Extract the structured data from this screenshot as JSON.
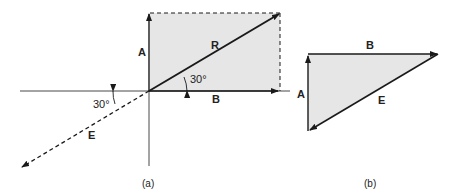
{
  "figure_a": {
    "caption": "(a)",
    "vectors": {
      "A": "A",
      "B": "B",
      "R": "R",
      "E": "E"
    },
    "angle_R": "30°",
    "angle_E": "30°"
  },
  "figure_b": {
    "caption": "(b)",
    "vectors": {
      "A": "A",
      "B": "B",
      "E": "E"
    }
  },
  "colors": {
    "fill": "#e6e6e6",
    "line": "#1a1a1a"
  }
}
